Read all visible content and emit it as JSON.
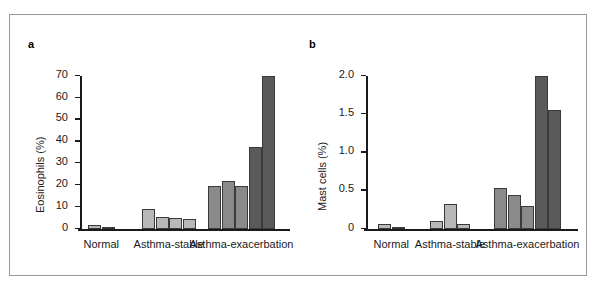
{
  "figure": {
    "panels": [
      {
        "letter": "a",
        "ylabel": "Eosinophils (%)",
        "yticks": [
          "0",
          "10",
          "20",
          "30",
          "40",
          "50",
          "60",
          "70"
        ],
        "groups": [
          "Normal",
          "Asthma-stable",
          "Asthma-exacerbation"
        ]
      },
      {
        "letter": "b",
        "ylabel": "Mast cells (%)",
        "yticks": [
          "0",
          "0.5",
          "1.0",
          "1.5",
          "2.0"
        ],
        "groups": [
          "Normal",
          "Asthma-stable",
          "Asthma-exacerbation"
        ]
      }
    ]
  },
  "colors": {
    "bar_light": "#b8b8b8",
    "bar_medium": "#8a8a8a",
    "bar_dark": "#5a5a5a",
    "axis": "#1a1a1a",
    "frame": "#9a9a9a",
    "background": "#ffffff"
  },
  "chart_data": [
    {
      "type": "bar",
      "panel": "a",
      "title": "",
      "xlabel": "",
      "ylabel": "Eosinophils (%)",
      "ylim": [
        0,
        70
      ],
      "ytick_values": [
        0,
        10,
        20,
        30,
        40,
        50,
        60,
        70
      ],
      "ytick_labels": [
        "0",
        "10",
        "20",
        "30",
        "40",
        "50",
        "60",
        "70"
      ],
      "grid": false,
      "legend": "none",
      "categories": [
        "Normal",
        "Asthma-stable",
        "Asthma-exacerbation"
      ],
      "groups": [
        {
          "category": "Normal",
          "values": [
            1.8,
            1.0
          ],
          "shades": [
            "bar_light",
            "bar_light"
          ]
        },
        {
          "category": "Asthma-stable",
          "values": [
            9.0,
            5.5,
            5.0,
            4.5
          ],
          "shades": [
            "bar_light",
            "bar_light",
            "bar_light",
            "bar_light"
          ]
        },
        {
          "category": "Asthma-exacerbation",
          "values": [
            19.5,
            22.0,
            19.5,
            37.5,
            70.0
          ],
          "shades": [
            "bar_medium",
            "bar_medium",
            "bar_medium",
            "bar_dark",
            "bar_dark"
          ]
        }
      ]
    },
    {
      "type": "bar",
      "panel": "b",
      "title": "",
      "xlabel": "",
      "ylabel": "Mast cells (%)",
      "ylim": [
        0,
        2.0
      ],
      "ytick_values": [
        0,
        0.5,
        1.0,
        1.5,
        2.0
      ],
      "ytick_labels": [
        "0",
        "0.5",
        "1.0",
        "1.5",
        "2.0"
      ],
      "grid": false,
      "legend": "none",
      "categories": [
        "Normal",
        "Asthma-stable",
        "Asthma-exacerbation"
      ],
      "groups": [
        {
          "category": "Normal",
          "values": [
            0.06,
            0.015
          ],
          "shades": [
            "bar_light",
            "bar_light"
          ]
        },
        {
          "category": "Asthma-stable",
          "values": [
            0.1,
            0.33,
            0.07
          ],
          "shades": [
            "bar_light",
            "bar_light",
            "bar_light"
          ]
        },
        {
          "category": "Asthma-exacerbation",
          "values": [
            0.53,
            0.44,
            0.3,
            2.0,
            1.55
          ],
          "shades": [
            "bar_medium",
            "bar_medium",
            "bar_medium",
            "bar_dark",
            "bar_dark"
          ]
        }
      ]
    }
  ]
}
